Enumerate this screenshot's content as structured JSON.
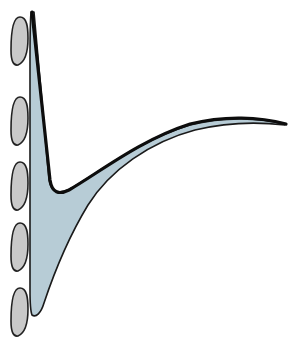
{
  "diagram": {
    "type": "illustration",
    "colors": {
      "background": "#ffffff",
      "main_fill": "#b7ccd6",
      "outline": "#111111",
      "oval_fill": "#c9c9c9",
      "oval_stroke": "#222222"
    },
    "ovals": [
      {
        "cx": 19,
        "cy": 41,
        "rx": 8.5,
        "ry": 24
      },
      {
        "cx": 19,
        "cy": 120,
        "rx": 8.5,
        "ry": 24
      },
      {
        "cx": 19,
        "cy": 185,
        "rx": 8.5,
        "ry": 24
      },
      {
        "cx": 19,
        "cy": 250,
        "rx": 8.5,
        "ry": 24
      },
      {
        "cx": 19,
        "cy": 310,
        "rx": 8.5,
        "ry": 24
      }
    ]
  }
}
